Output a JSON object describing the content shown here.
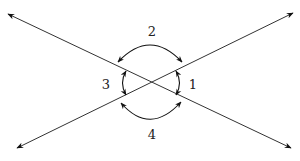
{
  "diagram": {
    "colors": {
      "line": "#333333",
      "arrow": "#111111",
      "background": "#ffffff"
    },
    "lines": [
      {
        "id": "line-a",
        "from": [
          8,
          14
        ],
        "to": [
          291,
          148
        ],
        "arrows": "both"
      },
      {
        "id": "line-b",
        "from": [
          17,
          148
        ],
        "to": [
          293,
          13
        ],
        "arrows": "both"
      }
    ],
    "intersection": [
      150,
      83
    ],
    "angles": [
      {
        "id": "1",
        "label": "1",
        "position": [
          192,
          84
        ],
        "arc": "right",
        "arrows": "both"
      },
      {
        "id": "2",
        "label": "2",
        "position": [
          152,
          30
        ],
        "arc": "top",
        "arrows": "both"
      },
      {
        "id": "3",
        "label": "3",
        "position": [
          106,
          84
        ],
        "arc": "left",
        "arrows": "both"
      },
      {
        "id": "4",
        "label": "4",
        "position": [
          152,
          134
        ],
        "arc": "bottom",
        "arrows": "both"
      }
    ]
  }
}
